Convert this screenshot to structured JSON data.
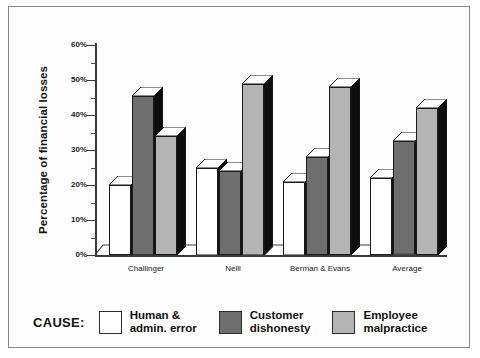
{
  "chart_data": {
    "type": "bar",
    "title": "",
    "xlabel": "",
    "ylabel": "Percentage of financial losses",
    "ylim": [
      0,
      60
    ],
    "ytick_labels": [
      "0%",
      "10%",
      "20%",
      "30%",
      "40%",
      "50%",
      "60%"
    ],
    "ytick_values": [
      0,
      10,
      20,
      30,
      40,
      50,
      60
    ],
    "grid": false,
    "legend_position": "bottom",
    "legend_title": "CAUSE:",
    "categories": [
      "Challinger",
      "Neill",
      "Berman & Evans",
      "Average"
    ],
    "series": [
      {
        "name": "Human & admin. error",
        "name_line1": "Human &",
        "name_line2": "admin. error",
        "color": "#ffffff",
        "values": [
          20,
          25,
          21,
          22
        ]
      },
      {
        "name": "Customer dishonesty",
        "name_line1": "Customer",
        "name_line2": "dishonesty",
        "color": "#6e6e6e",
        "values": [
          45.5,
          24,
          28,
          32.5
        ]
      },
      {
        "name": "Employee malpractice",
        "name_line1": "Employee",
        "name_line2": "malpractice",
        "color": "#b4b4b4",
        "values": [
          34,
          49,
          48,
          42
        ]
      }
    ]
  },
  "style": {
    "axis_color": "#3a3a3a",
    "outline_color": "#1a1a1a",
    "side_face_color": "#0d0d0d",
    "top_face_color": "#ffffff",
    "frame_color": "#8a8a8a",
    "background": "#ffffff"
  }
}
